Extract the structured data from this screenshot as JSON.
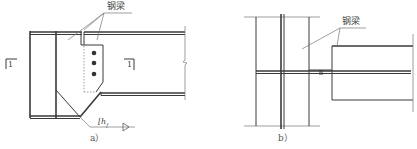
{
  "figure_a": {
    "caption": "a）",
    "beam_label": "钢梁",
    "section_mark_left": "1",
    "section_mark_right": "1",
    "weld_symbol": "⌊h",
    "weld_subscript": "f"
  },
  "figure_b": {
    "caption": "b）",
    "beam_label": "钢梁"
  },
  "colors": {
    "line": "#3a3a3a",
    "background": "#ffffff"
  }
}
